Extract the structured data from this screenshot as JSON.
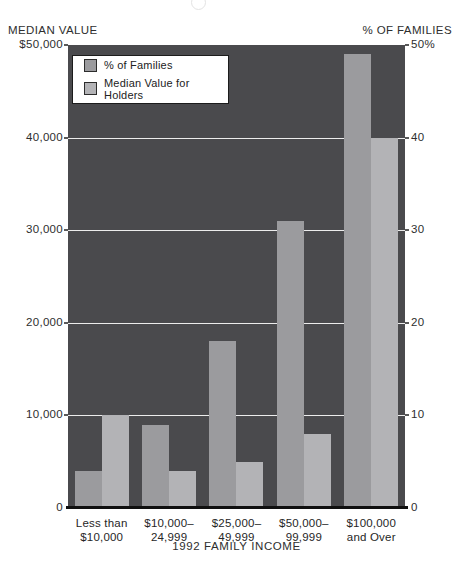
{
  "chart_data": {
    "type": "bar",
    "title": "",
    "xlabel": "1992 FAMILY INCOME",
    "categories": [
      "Less than $10,000",
      "$10,000–24,999",
      "$25,000–49,999",
      "$50,000–99,999",
      "$100,000 and Over"
    ],
    "category_lines": [
      [
        "Less than",
        "$10,000"
      ],
      [
        "$10,000–",
        "24,999"
      ],
      [
        "$25,000–",
        "49,999"
      ],
      [
        "$50,000–",
        "99,999"
      ],
      [
        "$100,000",
        "and Over"
      ]
    ],
    "left_axis": {
      "title": "MEDIAN VALUE",
      "ticks": [
        "$50,000",
        "40,000",
        "30,000",
        "20,000",
        "10,000",
        "0"
      ],
      "min": 0,
      "max": 50000
    },
    "right_axis": {
      "title": "% OF FAMILIES",
      "ticks": [
        "50%",
        "40",
        "30",
        "20",
        "10",
        "0"
      ],
      "min": 0,
      "max": 50
    },
    "series": [
      {
        "name": "% of Families",
        "axis": "right",
        "color": "#9b9b9e",
        "values": [
          4,
          9,
          18,
          31,
          49
        ]
      },
      {
        "name": "Median Value for Holders",
        "axis": "left",
        "color": "#b3b3b6",
        "values": [
          10000,
          4000,
          5000,
          8000,
          40000
        ]
      }
    ],
    "legend": {
      "position": "top-left",
      "items": [
        "% of Families",
        "Median Value for Holders"
      ]
    },
    "grid": true,
    "plot_background": "#4a4a4d",
    "gridline_color": "#ececec"
  }
}
